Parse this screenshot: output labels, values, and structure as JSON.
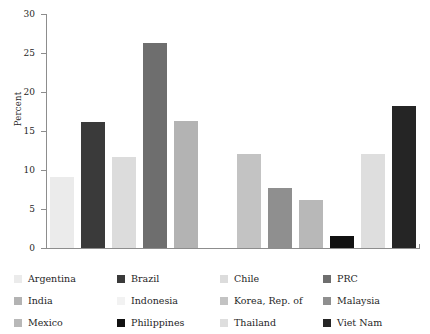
{
  "chart_data": {
    "type": "bar",
    "title": "",
    "xlabel": "",
    "ylabel": "Percent",
    "ylim": [
      0,
      30
    ],
    "yticks": [
      0,
      5,
      10,
      15,
      20,
      25,
      30
    ],
    "grid": false,
    "legend_position": "bottom",
    "categories": [
      "Argentina",
      "Brazil",
      "Chile",
      "PRC",
      "India",
      "Indonesia",
      "Korea, Rep. of",
      "Malaysia",
      "Mexico",
      "Philippines",
      "Thailand",
      "Viet Nam"
    ],
    "values": [
      9.1,
      16.1,
      11.7,
      26.3,
      16.3,
      0,
      12.0,
      7.7,
      6.1,
      1.5,
      12.0,
      18.2
    ],
    "colors": [
      "#ebebeb",
      "#3a3a3a",
      "#dcdcdc",
      "#6e6e6e",
      "#b3b3b3",
      "#f2f2f2",
      "#c3c3c3",
      "#8f8f8f",
      "#b8b8b8",
      "#111111",
      "#dedede",
      "#252525"
    ]
  },
  "axis": {
    "ylabel": "Percent",
    "ticks": [
      "30",
      "25",
      "20",
      "15",
      "10",
      "5",
      "0"
    ]
  },
  "legend": {
    "items": [
      {
        "label": "Argentina",
        "color": "#ebebeb"
      },
      {
        "label": "Brazil",
        "color": "#3a3a3a"
      },
      {
        "label": "Chile",
        "color": "#dcdcdc"
      },
      {
        "label": "PRC",
        "color": "#6e6e6e"
      },
      {
        "label": "India",
        "color": "#b3b3b3"
      },
      {
        "label": "Indonesia",
        "color": "#f2f2f2"
      },
      {
        "label": "Korea, Rep. of",
        "color": "#c3c3c3"
      },
      {
        "label": "Malaysia",
        "color": "#8f8f8f"
      },
      {
        "label": "Mexico",
        "color": "#b8b8b8"
      },
      {
        "label": "Philippines",
        "color": "#111111"
      },
      {
        "label": "Thailand",
        "color": "#dedede"
      },
      {
        "label": "Viet Nam",
        "color": "#252525"
      }
    ]
  }
}
